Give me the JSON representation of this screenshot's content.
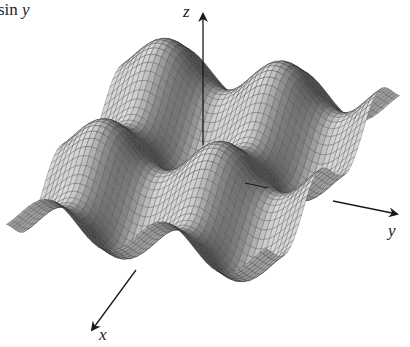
{
  "figure": {
    "title_fragment": "sin",
    "title_variable": "y",
    "axis_labels": {
      "x": "x",
      "y": "y",
      "z": "z"
    }
  },
  "chart_data": {
    "type": "surface",
    "function": "sin(x) + sin(y)",
    "xlabel": "x",
    "ylabel": "y",
    "zlabel": "z",
    "grid": true,
    "legend": null,
    "render_style": "gray shaded wireframe mesh",
    "x_range": [
      -7,
      7
    ],
    "y_range": [
      -7,
      7
    ],
    "z_range": [
      -2,
      2
    ],
    "colors": {
      "surface": "#b8b8b8",
      "mesh": "#2a2a2a",
      "shadow": "#3a3a3a",
      "axes": "#1a1a1a"
    }
  }
}
